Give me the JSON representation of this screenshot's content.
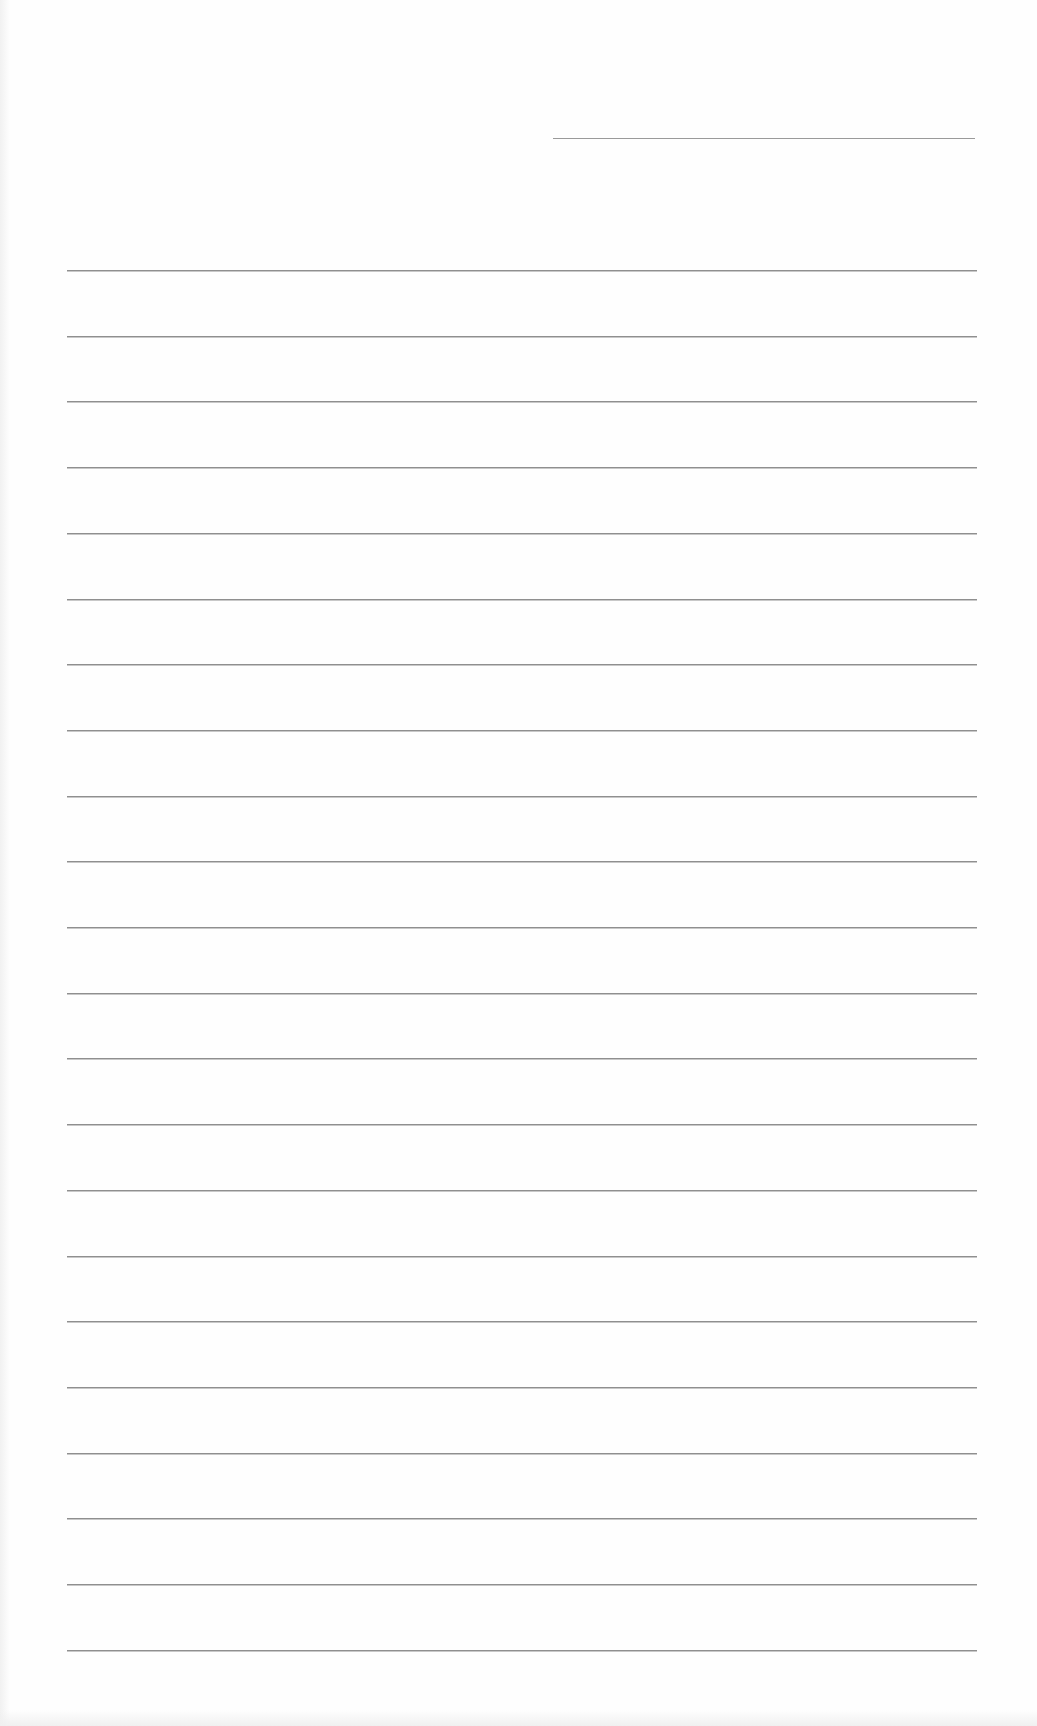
{
  "document": {
    "type": "blank lined paper",
    "header_line": {
      "x1": 553,
      "x2": 975,
      "y": 138
    },
    "ruled_lines": {
      "count": 22,
      "x1": 67,
      "x2": 977,
      "first_y": 270,
      "spacing": 65.7
    },
    "colors": {
      "paper": "#fefefe",
      "rule": "#8f8f8f"
    }
  }
}
